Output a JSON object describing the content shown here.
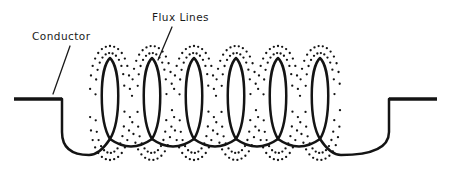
{
  "figure": {
    "background_color": "#ffffff",
    "ink_color": "#141414",
    "width": 451,
    "height": 178
  },
  "labels": {
    "conductor": {
      "text": "Conductor",
      "x": 32,
      "y": 40,
      "leader": {
        "x1": 70,
        "y1": 46,
        "x2": 53,
        "y2": 94
      }
    },
    "flux_lines": {
      "text": "Flux Lines",
      "x": 152,
      "y": 21,
      "leader": {
        "x1": 172,
        "y1": 27,
        "x2": 158,
        "y2": 60
      }
    }
  },
  "chart_data": {
    "type": "diagram",
    "annotations": [
      "Conductor",
      "Flux Lines"
    ],
    "coil": {
      "turn_count": 6,
      "turn_centers_x": [
        110,
        152,
        194,
        236,
        278,
        320
      ],
      "turn_pitch": 42,
      "loop_half_width": 11,
      "loop_top_y": 58,
      "loop_bottom_y": 139,
      "scallop_depth_y": 152,
      "stroke_width": 2.5
    },
    "terminals": {
      "left": {
        "x_start": 14,
        "x_end": 62,
        "y": 99,
        "drop_to_y": 132,
        "joins_x": 89
      },
      "right": {
        "x_start": 389,
        "x_end": 437,
        "y": 99,
        "drop_to_y": 132,
        "joins_x": 341
      },
      "stroke_width": 3.4
    },
    "flux_rings": {
      "description": "Dotted elliptical flux contours encircling each coil turn",
      "ring_count_per_turn": 2,
      "dot_radius": 1.15,
      "dot_color": "#141414",
      "outer_ring_rx": 20,
      "outer_ring_ry": 57,
      "inner_ring_rx": 14.5,
      "inner_ring_ry": 50,
      "ring_center_y": 103,
      "dots_per_ring": 30
    }
  }
}
